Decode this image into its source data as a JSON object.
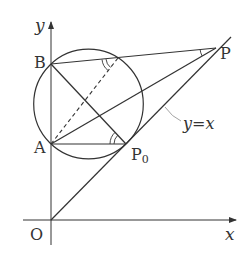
{
  "figure": {
    "type": "geometry"
  },
  "axes": {
    "x_label": "x",
    "y_label": "y",
    "origin_label": "O"
  },
  "points": {
    "A": {
      "label": "A"
    },
    "B": {
      "label": "B"
    },
    "P": {
      "label": "P"
    },
    "P0": {
      "label": "P",
      "subscript": "0"
    }
  },
  "line_label": "y=x",
  "colors": {
    "stroke": "#333333",
    "leader": "#999999",
    "background": "#ffffff"
  }
}
